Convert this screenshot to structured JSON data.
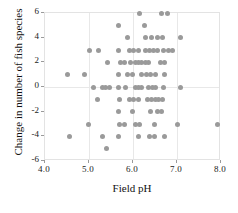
{
  "chart_data": {
    "type": "scatter",
    "title": "",
    "xlabel": "Field pH",
    "ylabel": "Change in number of fish species",
    "xlim": [
      4.0,
      8.0
    ],
    "ylim": [
      -6,
      6
    ],
    "xticks": [
      "4.0",
      "5.0",
      "6.0",
      "7.0",
      "8.0"
    ],
    "xtick_values": [
      4.0,
      5.0,
      6.0,
      7.0,
      8.0
    ],
    "yticks": [
      "6",
      "4",
      "2",
      "0",
      "-2",
      "-4",
      "-6"
    ],
    "ytick_values": [
      6,
      4,
      2,
      0,
      -2,
      -4,
      -6
    ],
    "grid": true,
    "legend": null,
    "marker_color": "#9a9a9a",
    "points": [
      [
        6.15,
        6
      ],
      [
        6.65,
        6
      ],
      [
        6.78,
        6
      ],
      [
        5.68,
        5
      ],
      [
        6.25,
        5
      ],
      [
        5.88,
        4
      ],
      [
        6.28,
        4
      ],
      [
        6.42,
        4
      ],
      [
        6.55,
        4
      ],
      [
        6.68,
        4
      ],
      [
        7.08,
        4
      ],
      [
        5.02,
        3
      ],
      [
        5.22,
        3
      ],
      [
        5.68,
        3
      ],
      [
        5.92,
        3
      ],
      [
        6.02,
        3
      ],
      [
        6.12,
        3
      ],
      [
        6.28,
        3
      ],
      [
        6.38,
        3
      ],
      [
        6.46,
        3
      ],
      [
        6.56,
        3
      ],
      [
        6.7,
        3
      ],
      [
        6.8,
        3
      ],
      [
        6.9,
        3
      ],
      [
        5.42,
        2
      ],
      [
        5.72,
        2
      ],
      [
        5.8,
        2
      ],
      [
        5.95,
        2
      ],
      [
        6.05,
        2
      ],
      [
        6.12,
        2
      ],
      [
        6.2,
        2
      ],
      [
        6.28,
        2
      ],
      [
        6.36,
        2
      ],
      [
        6.62,
        2
      ],
      [
        6.72,
        2
      ],
      [
        4.52,
        1
      ],
      [
        4.9,
        1
      ],
      [
        5.68,
        1
      ],
      [
        5.88,
        1
      ],
      [
        5.98,
        1
      ],
      [
        6.2,
        1
      ],
      [
        6.3,
        1
      ],
      [
        6.4,
        1
      ],
      [
        6.5,
        1
      ],
      [
        6.72,
        1
      ],
      [
        5.1,
        0
      ],
      [
        5.3,
        0
      ],
      [
        5.38,
        0
      ],
      [
        5.46,
        0
      ],
      [
        5.68,
        0
      ],
      [
        5.82,
        0
      ],
      [
        6.05,
        0
      ],
      [
        6.12,
        0
      ],
      [
        6.2,
        0
      ],
      [
        6.36,
        0
      ],
      [
        6.44,
        0
      ],
      [
        6.52,
        0
      ],
      [
        6.7,
        0
      ],
      [
        7.08,
        0
      ],
      [
        5.2,
        -1
      ],
      [
        5.7,
        -1
      ],
      [
        5.92,
        -1
      ],
      [
        6.02,
        -1
      ],
      [
        6.12,
        -1
      ],
      [
        6.32,
        -1
      ],
      [
        6.42,
        -1
      ],
      [
        6.5,
        -1
      ],
      [
        6.58,
        -1
      ],
      [
        6.66,
        -1
      ],
      [
        5.66,
        -2
      ],
      [
        5.98,
        -2
      ],
      [
        6.4,
        -2
      ],
      [
        6.55,
        -2
      ],
      [
        6.65,
        -2
      ],
      [
        4.98,
        -3
      ],
      [
        5.7,
        -3
      ],
      [
        5.8,
        -3
      ],
      [
        6.05,
        -3
      ],
      [
        6.15,
        -3
      ],
      [
        6.48,
        -3
      ],
      [
        7.02,
        -3
      ],
      [
        7.92,
        -3
      ],
      [
        4.55,
        -4
      ],
      [
        5.3,
        -4
      ],
      [
        5.68,
        -4
      ],
      [
        6.12,
        -4
      ],
      [
        6.38,
        -4
      ],
      [
        6.48,
        -4
      ],
      [
        6.72,
        -4
      ],
      [
        5.4,
        -5
      ]
    ]
  }
}
